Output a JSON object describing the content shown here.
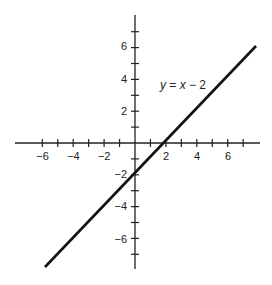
{
  "chart_data": {
    "type": "line",
    "title": "",
    "xlabel": "",
    "ylabel": "",
    "xlim": [
      -7.8,
      8.1
    ],
    "ylim": [
      -8.2,
      8.1
    ],
    "grid": false,
    "x_ticks": [
      -6,
      -5,
      -4,
      -3,
      -2,
      -1,
      1,
      2,
      3,
      4,
      5,
      6,
      7
    ],
    "x_tick_labels": [
      "-6",
      "-4",
      "-2",
      "2",
      "4",
      "6"
    ],
    "x_tick_label_values": [
      -6,
      -4,
      -2,
      2,
      4,
      6
    ],
    "y_ticks": [
      -7,
      -6,
      -5,
      -4,
      -3,
      -2,
      -1,
      1,
      2,
      3,
      4,
      5,
      6,
      7
    ],
    "y_tick_labels": [
      "6",
      "4",
      "2",
      "-2",
      "-4",
      "-6"
    ],
    "y_tick_label_values": [
      6,
      4,
      2,
      -2,
      -4,
      -6
    ],
    "series": [
      {
        "name": "y = x - 2",
        "equation": "y = x - 2",
        "slope": 1,
        "intercept": -2,
        "x": [
          -5.9,
          8
        ],
        "y": [
          -7.9,
          6
        ],
        "color": "#111111"
      }
    ],
    "annotations": [
      {
        "text": "y = x − 2",
        "x": 1.6,
        "y": 3.4
      }
    ]
  },
  "labels": {
    "equation_y": "y",
    "equation_mid": " = ",
    "equation_x": "x",
    "equation_tail": " − 2",
    "x_ticks": [
      "−6",
      "−4",
      "−2",
      "2",
      "4",
      "6"
    ],
    "y_ticks": [
      "6",
      "4",
      "2",
      "−2",
      "−4",
      "−6"
    ]
  }
}
